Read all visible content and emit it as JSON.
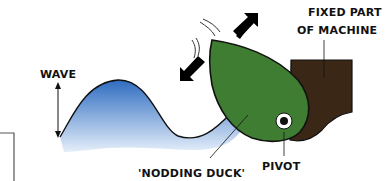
{
  "diagram": {
    "labels": {
      "wave": "WAVE",
      "fixed_part_line1": "FIXED PART",
      "fixed_part_line2": "OF MACHINE",
      "nodding_duck": "'NODDING DUCK'",
      "pivot": "PIVOT"
    },
    "colors": {
      "wave_top": "#2f6cc0",
      "wave_bottom": "#d6e6f7",
      "duck": "#3f7d32",
      "fixed_part": "#3a2716",
      "arrows": "#000000"
    }
  }
}
